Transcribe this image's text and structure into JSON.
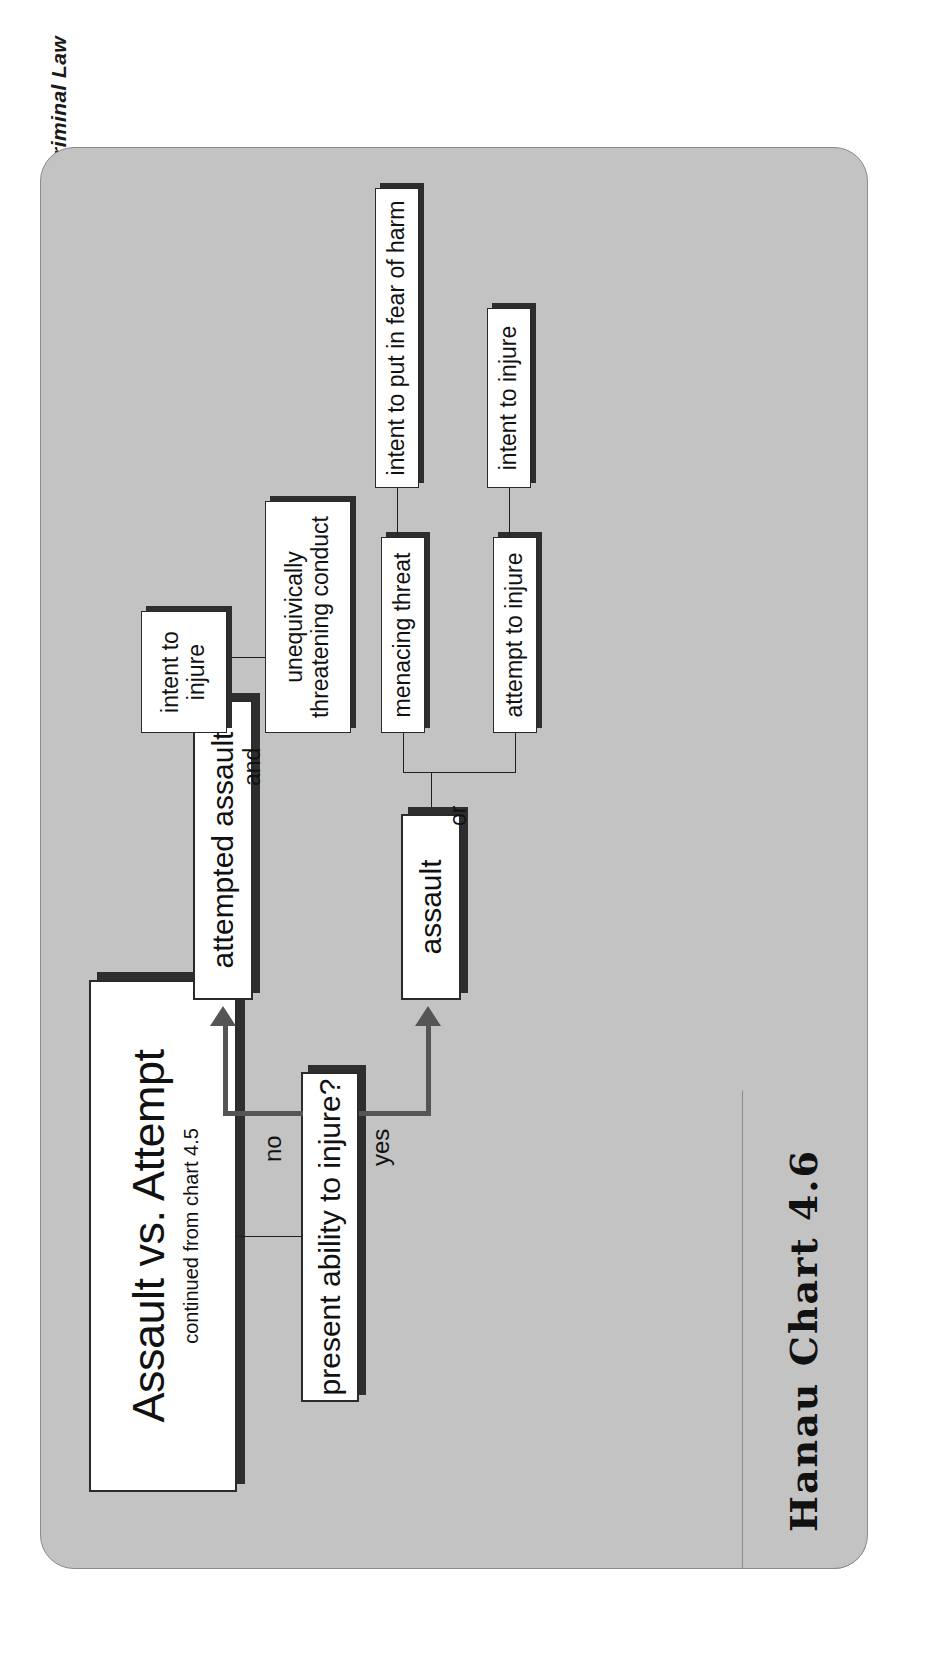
{
  "chart": {
    "title": "Assault vs. Attempt",
    "subtitle": "continued from chart 4.5",
    "footer_label": "Hanau Chart 4.6",
    "credit": "Blond's Criminal Law",
    "colors": {
      "panel_bg": "#c3c3c3",
      "node_bg": "#ffffff",
      "node_border": "#2a2a2a",
      "node_shadow": "#2e2e2e",
      "arrow": "#555555",
      "connector": "#1f1f1f",
      "text": "#111111"
    }
  },
  "decision": {
    "question": "present ability to injure?",
    "yes_label": "yes",
    "no_label": "no"
  },
  "branches": {
    "yes": {
      "outcome": "assault",
      "connector": "or",
      "options": [
        {
          "label": "menacing threat",
          "requirement": "intent to put in fear of harm"
        },
        {
          "label": "attempt to injure",
          "requirement": "intent to injure"
        }
      ]
    },
    "no": {
      "outcome": "attempted assault",
      "connector": "and",
      "elements": [
        {
          "label": "intent to injure"
        },
        {
          "label": "unequivically threatening conduct"
        }
      ]
    }
  }
}
